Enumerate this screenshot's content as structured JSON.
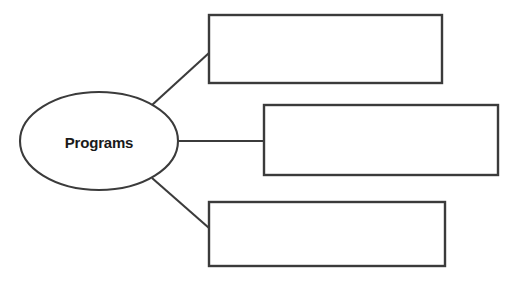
{
  "diagram": {
    "type": "concept-map",
    "canvas": {
      "width": 515,
      "height": 284,
      "background": "#ffffff"
    },
    "style": {
      "line_color": "#3b3b3b",
      "fill_color": "#ffffff",
      "text_color": "#1a1a1a"
    },
    "center_node": {
      "label": "Programs",
      "shape": "ellipse",
      "cx": 99,
      "cy": 141,
      "rx": 79,
      "ry": 49
    },
    "branches": [
      {
        "id": "branch-1",
        "label": "",
        "shape": "rectangle",
        "x": 209,
        "y": 15,
        "width": 233,
        "height": 68,
        "connector": {
          "x1": 152,
          "y1": 105,
          "x2": 209,
          "y2": 53
        }
      },
      {
        "id": "branch-2",
        "label": "",
        "shape": "rectangle",
        "x": 264,
        "y": 105,
        "width": 234,
        "height": 70,
        "connector": {
          "x1": 178,
          "y1": 141,
          "x2": 264,
          "y2": 141
        }
      },
      {
        "id": "branch-3",
        "label": "",
        "shape": "rectangle",
        "x": 209,
        "y": 202,
        "width": 236,
        "height": 64,
        "connector": {
          "x1": 152,
          "y1": 178,
          "x2": 209,
          "y2": 228
        }
      }
    ]
  }
}
